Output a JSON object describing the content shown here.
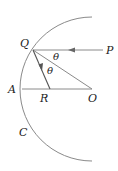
{
  "diagram": {
    "type": "geometry",
    "points": {
      "Q": {
        "label": "Q",
        "x": 33,
        "y": 50
      },
      "P": {
        "label": "P",
        "x": 103,
        "y": 50
      },
      "A": {
        "label": "A",
        "x": 22,
        "y": 89
      },
      "R": {
        "label": "R",
        "x": 50,
        "y": 89
      },
      "O": {
        "label": "O",
        "x": 92,
        "y": 89
      },
      "C": {
        "label": "C"
      }
    },
    "angles": [
      {
        "label": "θ",
        "between": [
          "QP",
          "QO"
        ]
      },
      {
        "label": "θ",
        "between": [
          "QO",
          "QR"
        ]
      }
    ],
    "arc": {
      "center": "O",
      "radius": 70,
      "label": "C"
    },
    "colors": {
      "lines": "#8a8a8a",
      "text": "#222222"
    }
  }
}
